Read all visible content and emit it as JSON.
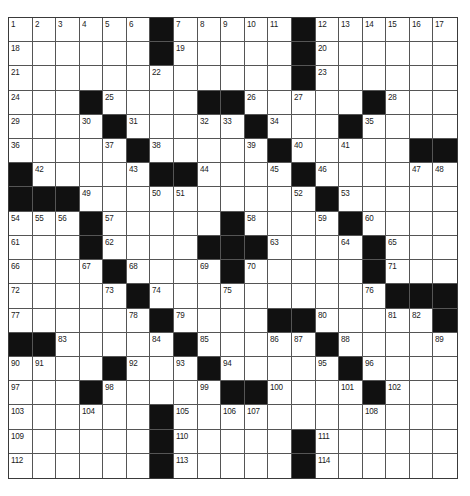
{
  "puzzle": {
    "rows": 19,
    "cols": 19,
    "colors": {
      "block": "#111111",
      "cell": "#ffffff",
      "gridline": "#555555",
      "number": "#222222"
    },
    "grid": [
      [
        "1",
        "2",
        "3",
        "4",
        "5",
        "6",
        "#",
        "7",
        "8",
        "9",
        "10",
        "11",
        "#",
        "12",
        "13",
        "14",
        "15",
        "16",
        "17"
      ],
      [
        "18",
        "",
        "",
        "",
        "",
        "",
        "#",
        "19",
        "",
        "",
        "",
        "",
        "#",
        "20",
        "",
        "",
        "",
        "",
        ""
      ],
      [
        "21",
        "",
        "",
        "",
        "",
        "",
        "22",
        "",
        "",
        "",
        "",
        "",
        "#",
        "23",
        "",
        "",
        "",
        "",
        ""
      ],
      [
        "24",
        "",
        "",
        "#",
        "25",
        "",
        "",
        "",
        "#",
        "#",
        "26",
        "",
        "27",
        "",
        "",
        "#",
        "28",
        "",
        ""
      ],
      [
        "29",
        "",
        "",
        "30",
        "#",
        "31",
        "",
        "",
        "32",
        "33",
        "#",
        "34",
        "",
        "",
        "#",
        "35",
        "",
        "",
        ""
      ],
      [
        "36",
        "",
        "",
        "",
        "37",
        "#",
        "38",
        "",
        "",
        "",
        "39",
        "#",
        "40",
        "",
        "41",
        "",
        "",
        "#",
        "#"
      ],
      [
        "#",
        "42",
        "",
        "",
        "",
        "43",
        "#",
        "#",
        "44",
        "",
        "",
        "45",
        "#",
        "46",
        "",
        "",
        "",
        "47",
        "48"
      ],
      [
        "#",
        "#",
        "#",
        "49",
        "",
        "",
        "50",
        "51",
        "",
        "",
        "",
        "",
        "52",
        "#",
        "53",
        "",
        "",
        "",
        ""
      ],
      [
        "54",
        "55",
        "56",
        "#",
        "57",
        "",
        "",
        "",
        "",
        "#",
        "58",
        "",
        "",
        "59",
        "#",
        "60",
        "",
        "",
        ""
      ],
      [
        "61",
        "",
        "",
        "#",
        "62",
        "",
        "",
        "",
        "#",
        "#",
        "#",
        "63",
        "",
        "",
        "64",
        "#",
        "65",
        "",
        ""
      ],
      [
        "66",
        "",
        "",
        "67",
        "#",
        "68",
        "",
        "",
        "69",
        "#",
        "70",
        "",
        "",
        "",
        "",
        "#",
        "71",
        "",
        ""
      ],
      [
        "72",
        "",
        "",
        "",
        "73",
        "#",
        "74",
        "",
        "",
        "75",
        "",
        "",
        "",
        "",
        "",
        "76",
        "#",
        "#",
        "#"
      ],
      [
        "77",
        "",
        "",
        "",
        "",
        "78",
        "#",
        "79",
        "",
        "",
        "",
        "#",
        "#",
        "80",
        "",
        "",
        "81",
        "82",
        "#"
      ],
      [
        "#",
        "#",
        "83",
        "",
        "",
        "",
        "84",
        "#",
        "85",
        "",
        "",
        "86",
        "87",
        "#",
        "88",
        "",
        "",
        "",
        "89"
      ],
      [
        "90",
        "91",
        "",
        "",
        "#",
        "92",
        "",
        "93",
        "#",
        "94",
        "",
        "",
        "",
        "95",
        "#",
        "96",
        "",
        "",
        ""
      ],
      [
        "97",
        "",
        "",
        "#",
        "98",
        "",
        "",
        "",
        "99",
        "#",
        "#",
        "100",
        "",
        "",
        "101",
        "#",
        "102",
        "",
        ""
      ],
      [
        "103",
        "",
        "",
        "104",
        "",
        "",
        "#",
        "105",
        "",
        "106",
        "107",
        "",
        "",
        "",
        "",
        "108",
        "",
        "",
        ""
      ],
      [
        "109",
        "",
        "",
        "",
        "",
        "",
        "#",
        "110",
        "",
        "",
        "",
        "",
        "#",
        "111",
        "",
        "",
        "",
        "",
        ""
      ],
      [
        "112",
        "",
        "",
        "",
        "",
        "",
        "#",
        "113",
        "",
        "",
        "",
        "",
        "#",
        "114",
        "",
        "",
        "",
        "",
        ""
      ]
    ]
  }
}
